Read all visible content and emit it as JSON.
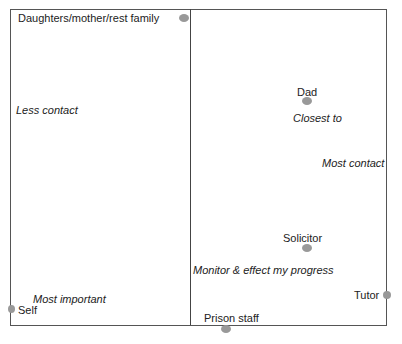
{
  "diagram": {
    "nodes": [
      {
        "label": "Daughters/mother/rest family"
      },
      {
        "label": "Dad"
      },
      {
        "label": "Solicitor"
      },
      {
        "label": "Tutor"
      },
      {
        "label": "Prison staff"
      },
      {
        "label": "Self"
      }
    ],
    "annotations": [
      {
        "text": "Less contact"
      },
      {
        "text": "Closest to"
      },
      {
        "text": "Most contact"
      },
      {
        "text": "Monitor & effect my progress"
      },
      {
        "text": "Most important"
      }
    ],
    "colors": {
      "dot": "#999999",
      "border": "#555555"
    }
  }
}
